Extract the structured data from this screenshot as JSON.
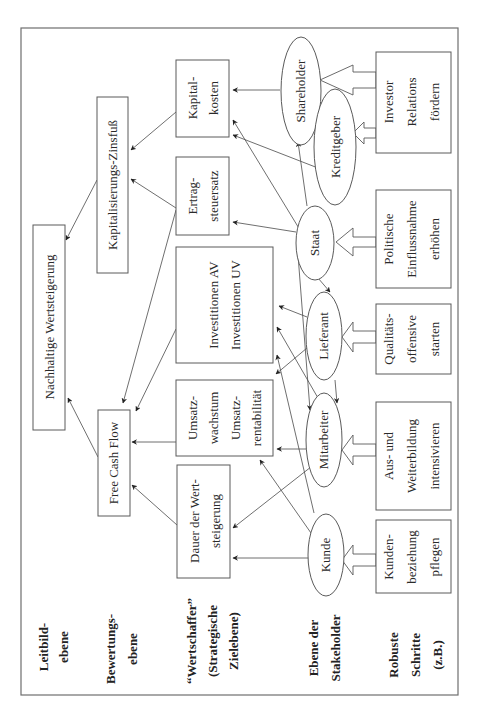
{
  "diagram": {
    "orientation": "rotated-90-ccw",
    "levels": [
      {
        "id": "leitbild",
        "lines": [
          "Leitbild-",
          "ebene"
        ]
      },
      {
        "id": "bewertung",
        "lines": [
          "Bewertungs-",
          "ebene"
        ]
      },
      {
        "id": "wertschaffer",
        "lines": [
          "“Wertschaffer”",
          "(Strategische",
          "Zielebene)"
        ]
      },
      {
        "id": "stakeholder",
        "lines": [
          "Ebene der",
          "Stakeholder"
        ]
      },
      {
        "id": "schritte",
        "lines": [
          "Robuste",
          "Schritte",
          "(z.B.)"
        ]
      }
    ],
    "nodes": {
      "nachhaltig": {
        "lines": [
          "Nachhaltige Wertsteigerung"
        ]
      },
      "zinsfuss": {
        "lines": [
          "Kapitalisierungs-Zinsfuß"
        ]
      },
      "fcf": {
        "lines": [
          "Free Cash Flow"
        ]
      },
      "kapitalkosten": {
        "lines": [
          "Kapital-",
          "kosten"
        ]
      },
      "ertragsteuer": {
        "lines": [
          "Ertrag-",
          "steuersatz"
        ]
      },
      "investitionen": {
        "lines": [
          "Investitionen AV",
          "Investitionen UV"
        ]
      },
      "umsatz": {
        "lines": [
          "Umsatz-",
          "wachstum",
          "Umsatz-",
          "rentabilität"
        ]
      },
      "dauer": {
        "lines": [
          "Dauer der Wert-",
          "steigerung"
        ]
      }
    },
    "stakeholders": {
      "shareholder": "Shareholder",
      "kreditgeber": "Kreditgeber",
      "staat": "Staat",
      "lieferant": "Lieferant",
      "mitarbeiter": "Mitarbeiter",
      "kunde": "Kunde"
    },
    "steps": {
      "investor": {
        "lines": [
          "Investor",
          "Relations",
          "fördern"
        ]
      },
      "politisch": {
        "lines": [
          "Politische",
          "Einflussnahme",
          "erhöhen"
        ]
      },
      "qualitaet": {
        "lines": [
          "Qualitäts-",
          "offensive",
          "starten"
        ]
      },
      "weiterbildung": {
        "lines": [
          "Aus- und",
          "Weiterbildung",
          "intensivieren"
        ]
      },
      "kundenbeziehung": {
        "lines": [
          "Kunden-",
          "beziehung",
          "pflegen"
        ]
      }
    },
    "edges": [
      [
        "zinsfuss",
        "nachhaltig"
      ],
      [
        "fcf",
        "nachhaltig"
      ],
      [
        "kapitalkosten",
        "zinsfuss"
      ],
      [
        "ertragsteuer",
        "zinsfuss"
      ],
      [
        "ertragsteuer",
        "fcf"
      ],
      [
        "investitionen",
        "fcf"
      ],
      [
        "umsatz",
        "fcf"
      ],
      [
        "dauer",
        "fcf"
      ],
      [
        "shareholder",
        "kapitalkosten"
      ],
      [
        "kreditgeber",
        "kapitalkosten"
      ],
      [
        "staat",
        "kapitalkosten"
      ],
      [
        "staat",
        "ertragsteuer"
      ],
      [
        "staat",
        "shareholder"
      ],
      [
        "staat",
        "lieferant"
      ],
      [
        "staat",
        "mitarbeiter"
      ],
      [
        "lieferant",
        "investitionen"
      ],
      [
        "lieferant",
        "umsatz"
      ],
      [
        "lieferant",
        "mitarbeiter"
      ],
      [
        "mitarbeiter",
        "investitionen"
      ],
      [
        "mitarbeiter",
        "umsatz"
      ],
      [
        "mitarbeiter",
        "dauer"
      ],
      [
        "kunde",
        "investitionen"
      ],
      [
        "kunde",
        "umsatz"
      ],
      [
        "kunde",
        "dauer"
      ],
      [
        "investor",
        "shareholder"
      ],
      [
        "investor",
        "kreditgeber"
      ],
      [
        "politisch",
        "staat"
      ],
      [
        "qualitaet",
        "lieferant"
      ],
      [
        "weiterbildung",
        "mitarbeiter"
      ],
      [
        "kundenbeziehung",
        "kunde"
      ]
    ]
  }
}
